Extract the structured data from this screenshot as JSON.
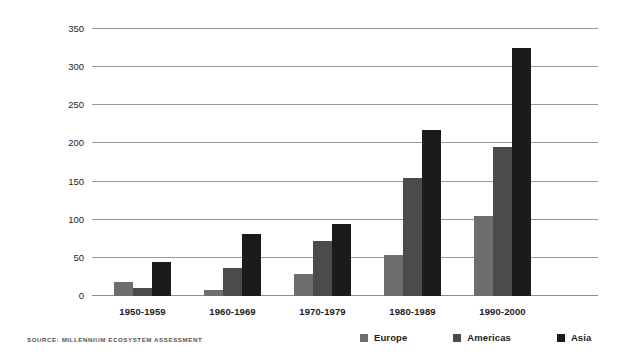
{
  "chart_data": {
    "type": "bar",
    "title": "",
    "xlabel": "",
    "ylabel": "Number of major floods",
    "categories": [
      "1950-1959",
      "1960-1969",
      "1970-1979",
      "1980-1989",
      "1990-2000"
    ],
    "series": [
      {
        "name": "Europe",
        "color": "#6e6e6e",
        "values": [
          19,
          8,
          29,
          54,
          105
        ]
      },
      {
        "name": "Americas",
        "color": "#4b4b4b",
        "values": [
          11,
          37,
          72,
          155,
          195
        ]
      },
      {
        "name": "Asia",
        "color": "#1b1b1b",
        "values": [
          45,
          81,
          95,
          218,
          325
        ]
      }
    ],
    "ylim": [
      0,
      350
    ],
    "yticks": [
      0,
      50,
      100,
      150,
      200,
      250,
      300,
      350
    ],
    "grid": true,
    "legend_position": "bottom-right",
    "annotations": [
      "SOURCE: MILLENNIUM ECOSYSTEM ASSESSMENT"
    ]
  },
  "footer": {
    "source": "SOURCE: MILLENNIUM ECOSYSTEM ASSESSMENT"
  }
}
